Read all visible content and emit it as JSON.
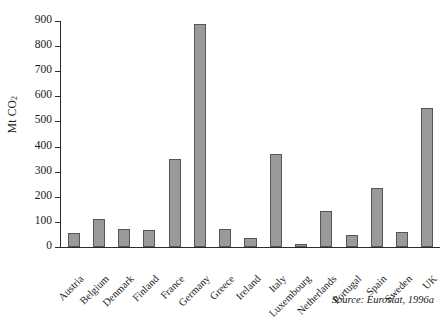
{
  "chart_data": {
    "type": "bar",
    "title": "",
    "subtitle": "",
    "xlabel": "",
    "ylabel": "Mt CO2",
    "ylabel_html_parts": {
      "main": "Mt CO",
      "sub": "2"
    },
    "ylim": [
      0,
      900
    ],
    "ytick_step": 100,
    "yticks": [
      0,
      100,
      200,
      300,
      400,
      500,
      600,
      700,
      800,
      900
    ],
    "ytick_labels": [
      "0",
      "100",
      "200",
      "300",
      "400",
      "500",
      "600",
      "700",
      "800",
      "900"
    ],
    "grid": false,
    "legend": "none",
    "categories": [
      "Austria",
      "Belgium",
      "Denmark",
      "Finland",
      "France",
      "Germany",
      "Greece",
      "Ireland",
      "Italy",
      "Luxembourg",
      "Netherlands",
      "Portugal",
      "Spain",
      "Sweden",
      "UK"
    ],
    "values": [
      56,
      112,
      72,
      66,
      352,
      888,
      73,
      35,
      372,
      12,
      143,
      48,
      235,
      60,
      552
    ],
    "bar_color": "#9a9a9a",
    "bar_edge_color": "#555555",
    "axis_color": "#2b2b2b",
    "background": "#ffffff"
  },
  "source": {
    "text": "Source: Eurostat, 1996a"
  }
}
